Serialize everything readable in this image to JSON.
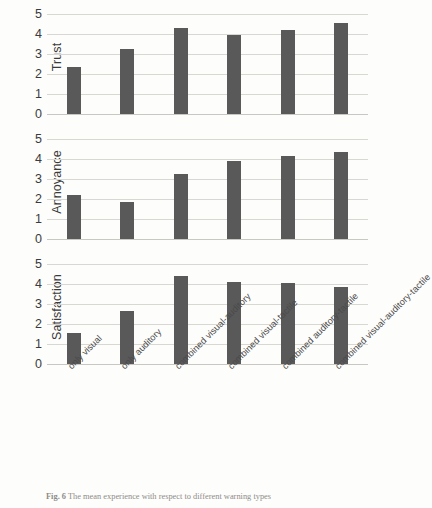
{
  "figure": {
    "caption_label": "Fig. 6",
    "caption_text": "The mean experience with respect to different warning types"
  },
  "chart_data": {
    "type": "bar",
    "title": "",
    "subtitle": "",
    "xlabel": "",
    "grid": true,
    "legend": false,
    "bar_color": "#595959",
    "ylim": [
      0,
      5
    ],
    "yticks": [
      0,
      1,
      2,
      3,
      4,
      5
    ],
    "categories": [
      "only visual",
      "only auditory",
      "combined visual-auditory",
      "combined visual-tactile",
      "combined auditory-tactile",
      "combined visual-auditory-tactile"
    ],
    "panels": [
      {
        "ylabel": "Trust",
        "values": [
          2.35,
          3.25,
          4.3,
          3.95,
          4.2,
          4.55
        ]
      },
      {
        "ylabel": "Annoyance",
        "values": [
          2.2,
          1.85,
          3.25,
          3.9,
          4.15,
          4.35
        ]
      },
      {
        "ylabel": "Satisfaction",
        "values": [
          1.55,
          2.65,
          4.4,
          4.1,
          4.05,
          3.85
        ]
      }
    ]
  }
}
